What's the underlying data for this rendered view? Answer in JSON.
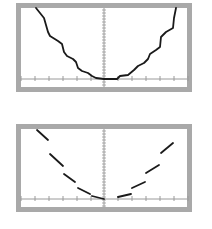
{
  "colors": {
    "background": "#ffffff",
    "frame": "#a9a9a9",
    "plot_background": "#ffffff",
    "axis": "#9a9a9a",
    "curve": "#1a1a1a"
  },
  "panels": [
    {
      "id": "top",
      "line_style": "solid",
      "frame": {
        "x": 16,
        "y": 3,
        "w": 176,
        "h": 89,
        "border": 5
      },
      "axis": {
        "x0": 104,
        "y0": 79
      },
      "points": [
        [
          36,
          8
        ],
        [
          44,
          18
        ],
        [
          48,
          32
        ],
        [
          50,
          36
        ],
        [
          58,
          41
        ],
        [
          62,
          44
        ],
        [
          64,
          52
        ],
        [
          67,
          56
        ],
        [
          73,
          59
        ],
        [
          76,
          62
        ],
        [
          78,
          68
        ],
        [
          82,
          71
        ],
        [
          88,
          73
        ],
        [
          92,
          76
        ],
        [
          96,
          78
        ],
        [
          104,
          79
        ],
        [
          117,
          79
        ],
        [
          120,
          76
        ],
        [
          128,
          75
        ],
        [
          134,
          70
        ],
        [
          138,
          66
        ],
        [
          144,
          63
        ],
        [
          148,
          59
        ],
        [
          150,
          54
        ],
        [
          156,
          50
        ],
        [
          160,
          47
        ],
        [
          161,
          37
        ],
        [
          166,
          32
        ],
        [
          173,
          28
        ],
        [
          174,
          18
        ],
        [
          176,
          8
        ]
      ]
    },
    {
      "id": "bottom",
      "line_style": "dashed",
      "frame": {
        "x": 16,
        "y": 124,
        "w": 176,
        "h": 88,
        "border": 5
      },
      "axis": {
        "x0": 104,
        "y0": 199
      },
      "segments": [
        [
          [
            37,
            130
          ],
          [
            48,
            140
          ]
        ],
        [
          [
            50,
            154
          ],
          [
            63,
            166
          ]
        ],
        [
          [
            64,
            174
          ],
          [
            75,
            182
          ]
        ],
        [
          [
            78,
            188
          ],
          [
            90,
            194
          ]
        ],
        [
          [
            92,
            196
          ],
          [
            104,
            199
          ]
        ],
        [
          [
            118,
            197
          ],
          [
            131,
            194
          ]
        ],
        [
          [
            132,
            188
          ],
          [
            145,
            182
          ]
        ],
        [
          [
            146,
            173
          ],
          [
            159,
            165
          ]
        ],
        [
          [
            161,
            153
          ],
          [
            173,
            143
          ]
        ]
      ]
    }
  ],
  "x_ticks": [
    21,
    35,
    49,
    63,
    77,
    91,
    118,
    132,
    146,
    160,
    174,
    188
  ]
}
